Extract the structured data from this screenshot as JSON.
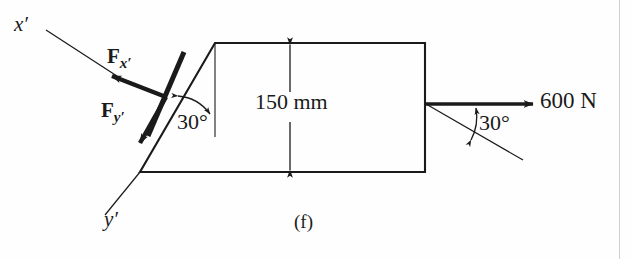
{
  "figure": {
    "caption": "(f)",
    "width": 633,
    "height": 259,
    "background_color": "#fefefe",
    "ink_color": "#1a1a1a"
  },
  "axes": {
    "x_prime_label": "x′",
    "y_prime_label": "y′"
  },
  "vectors": {
    "fx_prime": {
      "symbol": "F",
      "subscript": "x′"
    },
    "fy_prime": {
      "symbol": "F",
      "subscript": "y′"
    }
  },
  "dimensions": {
    "height_label": "150 mm",
    "height_value": 150,
    "height_unit": "mm"
  },
  "angles": {
    "left_incline": "30°",
    "left_incline_value": 30,
    "right_force": "30°",
    "right_force_value": 30,
    "unit": "degrees"
  },
  "loads": {
    "applied_force_label": "600 N",
    "applied_force_value": 600,
    "applied_force_unit": "N",
    "applied_force_direction": "horizontal-right"
  },
  "icons": {
    "arrowhead": "arrowhead-icon",
    "dimension_arrow": "dimension-arrow-icon",
    "angle_arc": "angle-arc-icon"
  }
}
